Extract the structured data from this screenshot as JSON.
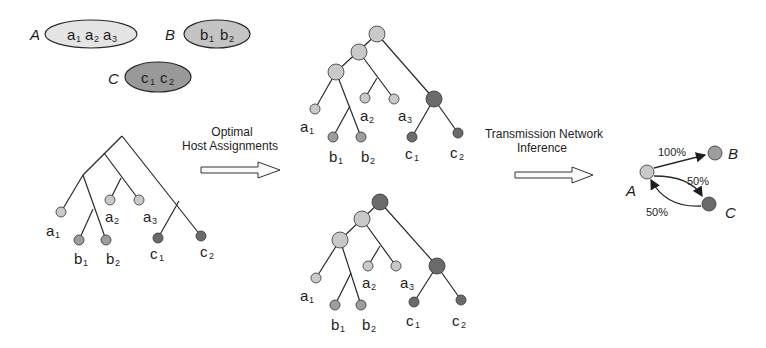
{
  "colors": {
    "host_a": "#c9c9c9",
    "host_b": "#9d9d9d",
    "host_c": "#6b6b6b",
    "line": "#2a2a2a",
    "text": "#1e1e1e"
  },
  "hosts": [
    {
      "name": "A",
      "samples": [
        "a",
        "a",
        "a"
      ],
      "subs": [
        "1",
        "2",
        "3"
      ]
    },
    {
      "name": "B",
      "samples": [
        "b",
        "b"
      ],
      "subs": [
        "1",
        "2"
      ]
    },
    {
      "name": "C",
      "samples": [
        "c",
        "c"
      ],
      "subs": [
        "1",
        "2"
      ]
    }
  ],
  "step1": {
    "line1": "Optimal",
    "line2": "Host Assignments"
  },
  "step2": {
    "line1": "Transmission Network",
    "line2": "Inference"
  },
  "leaves": {
    "a1": "a",
    "a2": "a",
    "a3": "a",
    "b1": "b",
    "b2": "b",
    "c1": "c",
    "c2": "c",
    "s1": "1",
    "s2": "2",
    "s3": "3"
  },
  "network": {
    "nodes": [
      "A",
      "B",
      "C"
    ],
    "edges": [
      {
        "from": "A",
        "to": "B",
        "label": "100%"
      },
      {
        "from": "A",
        "to": "C",
        "label": "50%"
      },
      {
        "from": "C",
        "to": "A",
        "label": "50%"
      }
    ]
  }
}
